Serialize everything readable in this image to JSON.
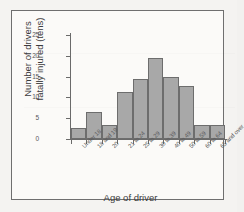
{
  "chart_data": {
    "type": "bar",
    "title": "",
    "xlabel": "Age of driver",
    "ylabel": "Number of drivers fatally injured (tens)",
    "ylabel_line1": "Number of drivers",
    "ylabel_line2": "fatally injured (tens)",
    "categories": [
      "Under 18",
      "18 and 19",
      "20",
      "21 to 24",
      "25 to 29",
      "30 to 39",
      "40 to 49",
      "50 to 59",
      "60 to 64",
      "65 and over"
    ],
    "values": [
      2.7,
      6.6,
      3.4,
      11.2,
      14.4,
      19.5,
      15.0,
      12.7,
      3.4,
      3.4
    ],
    "ylim": [
      0,
      25
    ],
    "yticks": [
      0,
      5,
      10,
      15,
      20,
      25
    ],
    "ytick_labels": [
      "0",
      "5",
      "10",
      "15",
      "20",
      "25"
    ],
    "grid": false,
    "legend": false,
    "bar_fill": "#a8a8a8",
    "bar_edge": "#6d6d6d",
    "axis_color": "#6a6a6a",
    "background": "#fbfaf8"
  }
}
